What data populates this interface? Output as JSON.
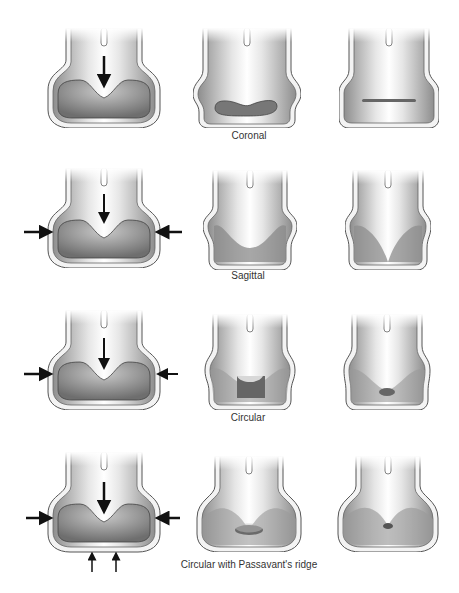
{
  "rows": [
    {
      "label": "Coronal"
    },
    {
      "label": "Sagittal"
    },
    {
      "label": "Circular"
    },
    {
      "label": "Circular with Passavant's ridge"
    }
  ],
  "colors": {
    "outer_wall": "#f2f2f2",
    "wall_stroke": "#555555",
    "muscle": "#9a9a9a",
    "cavity": "#7a7a7a",
    "arrow": "#111111"
  }
}
